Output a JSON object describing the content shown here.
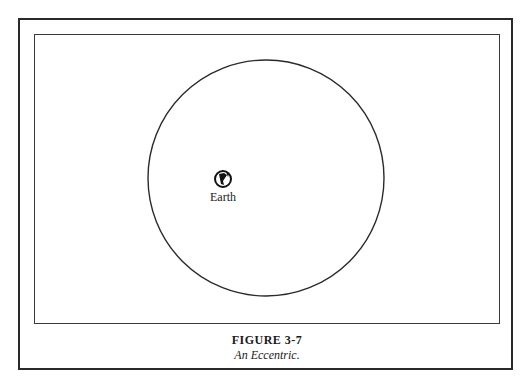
{
  "diagram": {
    "earth_label": "Earth",
    "earth_icon": "earth-globe-icon",
    "orbit": "eccentric-circle"
  },
  "caption": {
    "figure_number": "FIGURE 3-7",
    "figure_title": "An Eccentric."
  }
}
